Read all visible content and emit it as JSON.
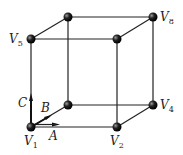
{
  "diagram": {
    "vertices": [
      {
        "id": "V1",
        "label": "V",
        "sub": "1",
        "x": 31,
        "y": 127,
        "lx": 24,
        "ly": 146
      },
      {
        "id": "V2",
        "label": "V",
        "sub": "2",
        "x": 117,
        "y": 127,
        "lx": 110,
        "ly": 146
      },
      {
        "id": "V4",
        "label": "V",
        "sub": "4",
        "x": 153,
        "y": 105,
        "lx": 160,
        "ly": 110
      },
      {
        "id": "V5",
        "label": "V",
        "sub": "5",
        "x": 31,
        "y": 39,
        "lx": 10,
        "ly": 44
      },
      {
        "id": "V8",
        "label": "V",
        "sub": "8",
        "x": 153,
        "y": 17,
        "lx": 160,
        "ly": 22
      },
      {
        "id": "back-top-left",
        "x": 68,
        "y": 17
      },
      {
        "id": "front-top-right",
        "x": 117,
        "y": 39
      },
      {
        "id": "back-bottom-left",
        "x": 68,
        "y": 105
      }
    ],
    "vectors": [
      {
        "name": "A",
        "label_x": 50,
        "label_y": 140
      },
      {
        "name": "B",
        "label_x": 42,
        "label_y": 113
      },
      {
        "name": "C",
        "label_x": 19,
        "label_y": 107
      }
    ],
    "colors": {
      "line": "#222222",
      "vertex": "#111111"
    }
  }
}
